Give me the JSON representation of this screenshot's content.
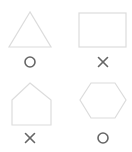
{
  "colors": {
    "shape_stroke": "#dcdcdc",
    "mark_stroke": "#666666",
    "background": "#ffffff"
  },
  "items": [
    {
      "shape": "triangle",
      "mark": "circle",
      "mark_meaning": "correct"
    },
    {
      "shape": "rectangle",
      "mark": "cross",
      "mark_meaning": "incorrect"
    },
    {
      "shape": "pentagon",
      "mark": "cross",
      "mark_meaning": "incorrect"
    },
    {
      "shape": "hexagon",
      "mark": "circle",
      "mark_meaning": "correct"
    }
  ]
}
